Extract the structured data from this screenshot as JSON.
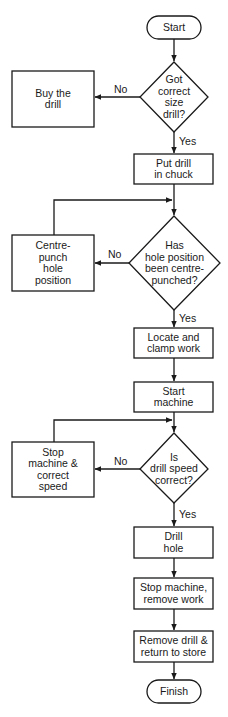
{
  "diagram": {
    "type": "flowchart",
    "nodes": [
      {
        "id": "start",
        "kind": "terminal",
        "label": "Start"
      },
      {
        "id": "q_drill",
        "kind": "decision",
        "label": "Got\ncorrect\nsize\ndrill?"
      },
      {
        "id": "buy",
        "kind": "process",
        "label": "Buy the\ndrill"
      },
      {
        "id": "chuck",
        "kind": "process",
        "label": "Put drill\nin chuck"
      },
      {
        "id": "q_punch",
        "kind": "decision",
        "label": "Has\nhole position\nbeen centre-\npunched?"
      },
      {
        "id": "punch",
        "kind": "process",
        "label": "Centre-\npunch\nhole\nposition"
      },
      {
        "id": "clamp",
        "kind": "process",
        "label": "Locate and\nclamp work"
      },
      {
        "id": "start_machine",
        "kind": "process",
        "label": "Start\nmachine"
      },
      {
        "id": "q_speed",
        "kind": "decision",
        "label": "Is\ndrill speed\ncorrect?"
      },
      {
        "id": "fix_speed",
        "kind": "process",
        "label": "Stop\nmachine &\ncorrect\nspeed"
      },
      {
        "id": "drill",
        "kind": "process",
        "label": "Drill\nhole"
      },
      {
        "id": "stop",
        "kind": "process",
        "label": "Stop machine,\nremove work"
      },
      {
        "id": "remove",
        "kind": "process",
        "label": "Remove drill &\nreturn to store"
      },
      {
        "id": "finish",
        "kind": "terminal",
        "label": "Finish"
      }
    ],
    "edges": [
      {
        "from": "start",
        "to": "q_drill",
        "label": ""
      },
      {
        "from": "q_drill",
        "to": "buy",
        "label": "No"
      },
      {
        "from": "q_drill",
        "to": "chuck",
        "label": "Yes"
      },
      {
        "from": "chuck",
        "to": "q_punch",
        "label": ""
      },
      {
        "from": "q_punch",
        "to": "punch",
        "label": "No"
      },
      {
        "from": "punch",
        "to": "q_punch",
        "label": ""
      },
      {
        "from": "q_punch",
        "to": "clamp",
        "label": "Yes"
      },
      {
        "from": "clamp",
        "to": "start_machine",
        "label": ""
      },
      {
        "from": "start_machine",
        "to": "q_speed",
        "label": ""
      },
      {
        "from": "q_speed",
        "to": "fix_speed",
        "label": "No"
      },
      {
        "from": "fix_speed",
        "to": "q_speed",
        "label": ""
      },
      {
        "from": "q_speed",
        "to": "drill",
        "label": "Yes"
      },
      {
        "from": "drill",
        "to": "stop",
        "label": ""
      },
      {
        "from": "stop",
        "to": "remove",
        "label": ""
      },
      {
        "from": "remove",
        "to": "finish",
        "label": ""
      }
    ],
    "edge_labels": {
      "no": "No",
      "yes": "Yes"
    },
    "colors": {
      "stroke": "#1a1a1a",
      "fill": "#ffffff"
    }
  }
}
